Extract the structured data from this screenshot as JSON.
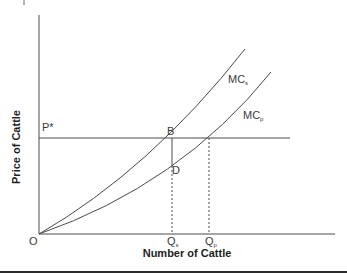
{
  "diagram": {
    "type": "economics-marginal-cost",
    "y_axis_label": "Price of Cattle",
    "x_axis_label": "Number of Cattle",
    "origin_label": "O",
    "price_label": "P*",
    "curves": [
      {
        "name": "MC",
        "subscript": "s",
        "description": "social marginal cost (steeper curve)"
      },
      {
        "name": "MC",
        "subscript": "p",
        "description": "private marginal cost (flatter curve)"
      }
    ],
    "points": [
      {
        "label": "B",
        "description": "intersection of P* and MC_s"
      },
      {
        "label": "D",
        "description": "point on MC_p directly below B"
      }
    ],
    "quantities": [
      {
        "label": "Q",
        "subscript": "s"
      },
      {
        "label": "Q",
        "subscript": "p"
      }
    ],
    "colors": {
      "line": "#4a4a4a",
      "text": "#3a3a3a",
      "rule": "#2a2a2a",
      "background": "#ffffff"
    }
  }
}
